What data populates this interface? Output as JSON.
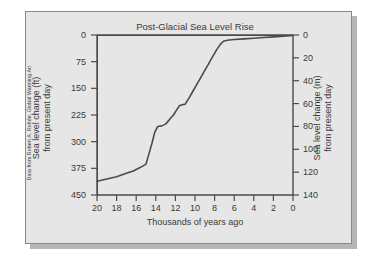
{
  "figure": {
    "credit": "Data from Robert A. Rohde, Global Warming Art",
    "panel_color": "#e6e6e6",
    "line_color": "#4a4a4a"
  },
  "chart_data": {
    "type": "line",
    "title": "Post-Glacial Sea Level Rise",
    "xlabel": "Thousands of years ago",
    "ylabel": "Sea level change (ft) from present day",
    "ylabel_right": "Sea level change (m) from present day",
    "ylabel_left_line1": "Sea level change (ft)",
    "ylabel_left_line2": "from present day",
    "ylabel_right_line1": "Sea level change (m)",
    "ylabel_right_line2": "from present day",
    "xlim": [
      20,
      0
    ],
    "xticks": [
      20,
      18,
      16,
      14,
      12,
      10,
      8,
      6,
      4,
      2,
      0
    ],
    "xtick_labels": [
      "20",
      "18",
      "16",
      "14",
      "12",
      "10",
      "8",
      "6",
      "4",
      "2",
      "0"
    ],
    "ylim_ft": [
      450,
      0
    ],
    "yticks_ft": [
      0,
      75,
      150,
      225,
      300,
      375,
      450
    ],
    "ytick_labels_ft": [
      "0",
      "75",
      "150",
      "225",
      "300",
      "375",
      "450"
    ],
    "ylim_m": [
      140,
      0
    ],
    "yticks_m": [
      0,
      20,
      40,
      60,
      80,
      100,
      120,
      140
    ],
    "ytick_labels_m": [
      "0",
      "20",
      "40",
      "60",
      "80",
      "100",
      "120",
      "140"
    ],
    "grid": false,
    "legend": false,
    "x_units": "thousands of years ago",
    "y_units_left": "feet below present day",
    "y_units_right": "meters below present day",
    "series": [
      {
        "name": "Sea level change",
        "x": [
          20.0,
          19.0,
          18.0,
          17.0,
          16.3,
          15.6,
          15.0,
          14.7,
          14.4,
          14.1,
          13.8,
          13.4,
          13.0,
          12.6,
          12.2,
          11.9,
          11.6,
          11.3,
          11.0,
          10.6,
          10.2,
          9.8,
          9.4,
          9.0,
          8.6,
          8.2,
          7.8,
          7.4,
          7.1,
          6.7,
          6.0,
          5.0,
          4.0,
          3.0,
          2.0,
          1.0,
          0.0
        ],
        "y_m": [
          128.0,
          126.0,
          124.0,
          121.0,
          119.0,
          116.0,
          113.0,
          104.0,
          95.0,
          85.0,
          80.0,
          79.5,
          78.0,
          74.0,
          70.0,
          66.0,
          62.0,
          61.0,
          60.5,
          55.0,
          49.0,
          43.0,
          37.0,
          31.0,
          25.0,
          19.0,
          13.0,
          8.0,
          5.5,
          4.6,
          4.0,
          3.4,
          2.8,
          2.2,
          1.6,
          1.0,
          0.4
        ],
        "y_ft": [
          420.0,
          413.4,
          406.8,
          397.0,
          390.4,
          380.6,
          370.8,
          341.2,
          311.7,
          278.9,
          262.5,
          260.8,
          255.9,
          242.8,
          229.7,
          216.5,
          203.4,
          200.1,
          198.5,
          180.4,
          160.8,
          141.1,
          121.4,
          101.7,
          82.0,
          62.3,
          42.7,
          26.2,
          18.0,
          15.1,
          13.1,
          11.2,
          9.2,
          7.2,
          5.2,
          3.3,
          1.3
        ]
      }
    ],
    "annotations": []
  }
}
